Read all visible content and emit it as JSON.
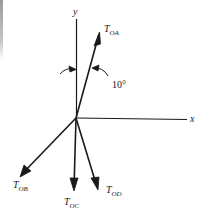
{
  "diagram": {
    "type": "force-vector-diagram",
    "axes": {
      "x_label": "x",
      "y_label": "y"
    },
    "vectors": [
      {
        "id": "OA",
        "label_main": "T",
        "label_sub": "OA"
      },
      {
        "id": "OB",
        "label_main": "T",
        "label_sub": "OB"
      },
      {
        "id": "OC",
        "label_main": "T",
        "label_sub": "OC"
      },
      {
        "id": "OD",
        "label_main": "T",
        "label_sub": "OD"
      }
    ],
    "angle": {
      "value_label": "10°",
      "between": [
        "y-axis",
        "T_OA"
      ]
    },
    "colors": {
      "ink": "#1a1a1a",
      "background": "#ffffff"
    }
  }
}
